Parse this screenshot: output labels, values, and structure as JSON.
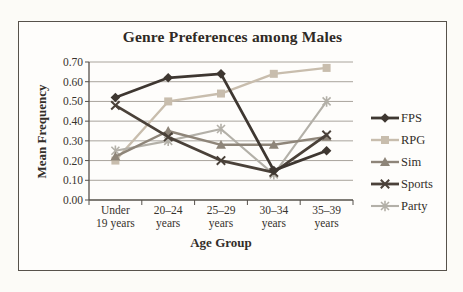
{
  "chart_data": {
    "type": "line",
    "title": "Genre Preferences among Males",
    "xlabel": "Age Group",
    "ylabel": "Mean Frequency",
    "categories": [
      "Under 19 years",
      "20–24 years",
      "25–29 years",
      "30–34 years",
      "35–39 years"
    ],
    "ylim": [
      0.0,
      0.7
    ],
    "ytick_step": 0.1,
    "ytick_labels": [
      "0.00",
      "0.10",
      "0.20",
      "0.30",
      "0.40",
      "0.50",
      "0.60",
      "0.70"
    ],
    "grid": true,
    "legend_position": "right",
    "series": [
      {
        "name": "FPS",
        "marker": "diamond",
        "color": "#3e3731",
        "values": [
          0.52,
          0.62,
          0.64,
          0.15,
          0.25
        ]
      },
      {
        "name": "RPG",
        "marker": "square",
        "color": "#c8bdad",
        "values": [
          0.2,
          0.5,
          0.54,
          0.64,
          0.67
        ]
      },
      {
        "name": "Sim",
        "marker": "triangle",
        "color": "#8e8579",
        "values": [
          0.22,
          0.35,
          0.28,
          0.28,
          0.32
        ]
      },
      {
        "name": "Sports",
        "marker": "x",
        "color": "#4a4139",
        "values": [
          0.48,
          0.32,
          0.2,
          0.14,
          0.33
        ]
      },
      {
        "name": "Party",
        "marker": "asterisk",
        "color": "#b3b0a8",
        "values": [
          0.25,
          0.3,
          0.36,
          0.13,
          0.5
        ]
      }
    ],
    "colors": {
      "gridline": "#a9a49c",
      "axis": "#55504a",
      "text": "#37322c",
      "frame_border": "#57524b",
      "background": "#fcfbf7"
    }
  }
}
